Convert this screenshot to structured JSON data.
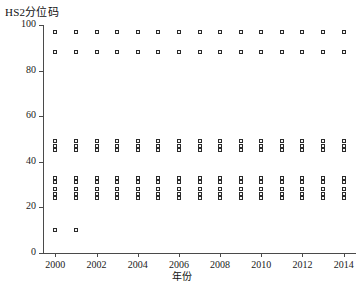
{
  "chart_data": {
    "type": "scatter",
    "title": "HS2分位码",
    "xlabel": "年份",
    "ylabel": "",
    "xlim": [
      1999.4,
      2014.6
    ],
    "ylim": [
      0,
      100
    ],
    "grid": false,
    "legend": "none",
    "marker": "open-square",
    "marker_color": "#2b2b2b",
    "xticks": [
      2000,
      2002,
      2004,
      2006,
      2008,
      2010,
      2012,
      2014
    ],
    "xtick_labels": [
      "2000",
      "2002",
      "2004",
      "2006",
      "2008",
      "2010",
      "2012",
      "2014"
    ],
    "yticks": [
      0,
      20,
      40,
      60,
      80,
      100
    ],
    "ytick_labels": [
      "0",
      "20",
      "40",
      "60",
      "80",
      "100"
    ],
    "x": [
      2000,
      2001,
      2002,
      2003,
      2004,
      2005,
      2006,
      2007,
      2008,
      2009,
      2010,
      2011,
      2012,
      2013,
      2014
    ],
    "series": [
      {
        "name": "q-97",
        "values": [
          97,
          97,
          97,
          97,
          97,
          97,
          97,
          97,
          97,
          97,
          97,
          97,
          97,
          97,
          97
        ]
      },
      {
        "name": "q-88",
        "values": [
          88,
          88,
          88,
          88,
          88,
          88,
          88,
          88,
          88,
          88,
          88,
          88,
          88,
          88,
          88
        ]
      },
      {
        "name": "q-49",
        "values": [
          49,
          49,
          49,
          49,
          49,
          49,
          49,
          49,
          49,
          49,
          49,
          49,
          49,
          49,
          49
        ]
      },
      {
        "name": "q-47",
        "values": [
          47,
          47,
          47,
          47,
          47,
          47,
          47,
          47,
          47,
          47,
          47,
          47,
          47,
          47,
          47
        ]
      },
      {
        "name": "q-45",
        "values": [
          45,
          45,
          45,
          45,
          45,
          45,
          45,
          45,
          45,
          45,
          45,
          45,
          45,
          45,
          45
        ]
      },
      {
        "name": "q-33",
        "values": [
          33,
          33,
          33,
          33,
          33,
          33,
          33,
          33,
          33,
          33,
          33,
          33,
          33,
          33,
          33
        ]
      },
      {
        "name": "q-31",
        "values": [
          31,
          31,
          31,
          31,
          31,
          31,
          31,
          31,
          31,
          31,
          31,
          31,
          31,
          31,
          31
        ]
      },
      {
        "name": "q-28",
        "values": [
          28,
          28,
          28,
          28,
          28,
          28,
          28,
          28,
          28,
          28,
          28,
          28,
          28,
          28,
          28
        ]
      },
      {
        "name": "q-26",
        "values": [
          26,
          26,
          26,
          26,
          26,
          26,
          26,
          26,
          26,
          26,
          26,
          26,
          26,
          26,
          26
        ]
      },
      {
        "name": "q-24",
        "values": [
          24,
          24,
          24,
          24,
          24,
          24,
          24,
          24,
          24,
          24,
          24,
          24,
          24,
          24,
          24
        ]
      },
      {
        "name": "q-10",
        "values": [
          10,
          10,
          null,
          null,
          null,
          null,
          null,
          null,
          null,
          null,
          null,
          null,
          null,
          null,
          null
        ]
      }
    ]
  }
}
